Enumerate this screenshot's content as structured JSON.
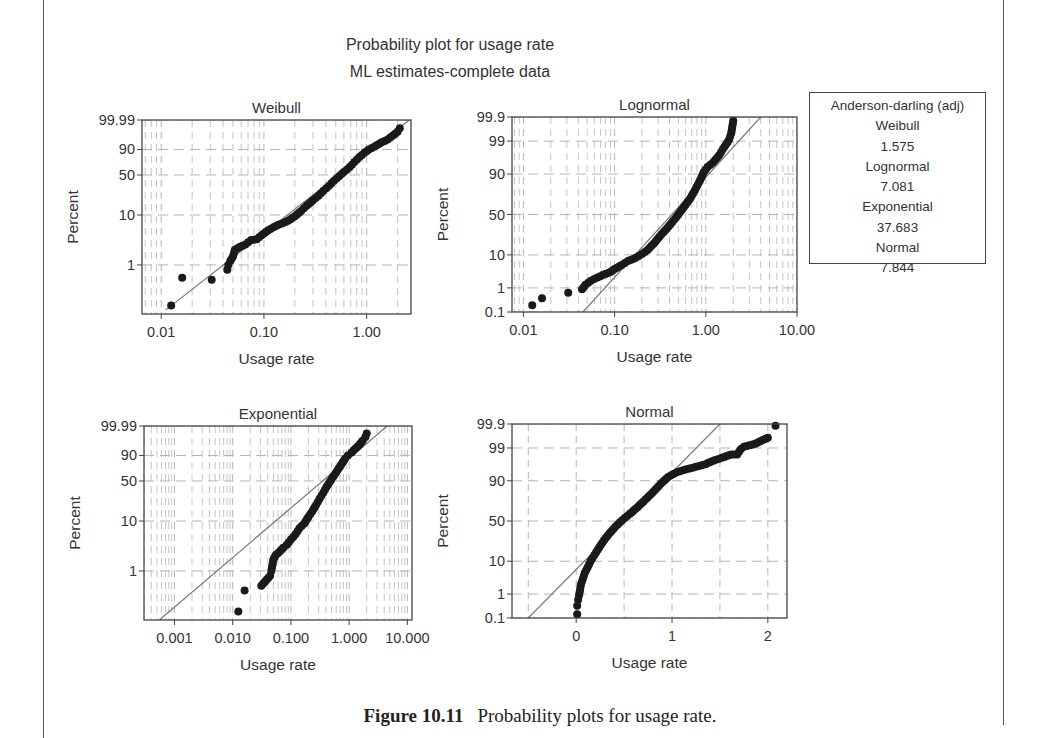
{
  "figure": {
    "title": "Probability plot for usage rate",
    "subtitle": "ML estimates-complete data",
    "caption_label": "Figure 10.11",
    "caption_text": "Probability plots for usage rate."
  },
  "legend": {
    "title": "Anderson-darling (adj)",
    "entries": [
      {
        "name": "Weibull",
        "value": "1.575"
      },
      {
        "name": "Lognormal",
        "value": "7.081"
      },
      {
        "name": "Exponential",
        "value": "37.683"
      },
      {
        "name": "Normal",
        "value": "7.844"
      }
    ]
  },
  "colors": {
    "points": "#1a1a1a",
    "fit_line": "#777777",
    "grid": "#b5b5b5",
    "frame": "#444444"
  },
  "chart_data": [
    {
      "type": "scatter",
      "title": "Weibull",
      "xlabel": "Usage rate",
      "ylabel": "Percent",
      "xscale": "log",
      "yscale": "weibull-probability",
      "xticks": [
        0.01,
        0.1,
        1.0
      ],
      "xtick_labels": [
        "0.01",
        "0.10",
        "1.00"
      ],
      "yticks": [
        1,
        10,
        50,
        90,
        99.99
      ],
      "ytick_labels": [
        "1",
        "10",
        "50",
        "90",
        "99.99"
      ],
      "xlim": [
        0.0065,
        2.7
      ],
      "ylim": [
        0.1,
        99.99
      ],
      "grid": true,
      "frame": {
        "x": 142,
        "y": 120,
        "w": 269,
        "h": 194
      },
      "fit_line": [
        [
          0.011,
          0.12
        ],
        [
          2.6,
          99.99
        ]
      ],
      "points": [
        [
          0.0125,
          0.15
        ],
        [
          0.016,
          0.55
        ],
        [
          0.031,
          0.5
        ],
        [
          0.044,
          0.8
        ],
        [
          0.045,
          1.0
        ],
        [
          0.047,
          1.2
        ],
        [
          0.05,
          1.5
        ],
        [
          0.052,
          2.0
        ],
        [
          0.058,
          2.3
        ],
        [
          0.066,
          2.6
        ],
        [
          0.075,
          3.2
        ],
        [
          0.085,
          3.3
        ],
        [
          0.095,
          4.0
        ],
        [
          0.11,
          5.0
        ],
        [
          0.125,
          5.8
        ],
        [
          0.14,
          6.5
        ],
        [
          0.16,
          7.2
        ],
        [
          0.18,
          8.2
        ],
        [
          0.2,
          9.5
        ],
        [
          0.23,
          12
        ],
        [
          0.26,
          15
        ],
        [
          0.3,
          19
        ],
        [
          0.34,
          23
        ],
        [
          0.38,
          28
        ],
        [
          0.43,
          34
        ],
        [
          0.48,
          41
        ],
        [
          0.54,
          48
        ],
        [
          0.6,
          55
        ],
        [
          0.68,
          63
        ],
        [
          0.76,
          72
        ],
        [
          0.85,
          80
        ],
        [
          0.95,
          86
        ],
        [
          1.05,
          90
        ],
        [
          1.2,
          93
        ],
        [
          1.4,
          96
        ],
        [
          1.6,
          97.5
        ],
        [
          1.8,
          98.8
        ],
        [
          2.0,
          99.5
        ],
        [
          2.1,
          99.8
        ]
      ]
    },
    {
      "type": "scatter",
      "title": "Lognormal",
      "xlabel": "Usage rate",
      "ylabel": "Percent",
      "xscale": "log",
      "yscale": "normal-probability",
      "xticks": [
        0.01,
        0.1,
        1.0,
        10.0
      ],
      "xtick_labels": [
        "0.01",
        "0.10",
        "1.00",
        "10.00"
      ],
      "yticks": [
        0.1,
        1,
        10,
        50,
        90,
        99,
        99.9
      ],
      "ytick_labels": [
        "0.1",
        "1",
        "10",
        "50",
        "90",
        "99",
        "99.9"
      ],
      "xlim": [
        0.0075,
        10.0
      ],
      "ylim": [
        0.1,
        99.9
      ],
      "grid": true,
      "frame": {
        "x": 512,
        "y": 117,
        "w": 285,
        "h": 195
      },
      "fit_line": [
        [
          0.045,
          0.1
        ],
        [
          4.0,
          99.9
        ]
      ],
      "points": [
        [
          0.0125,
          0.2
        ],
        [
          0.016,
          0.4
        ],
        [
          0.031,
          0.65
        ],
        [
          0.044,
          0.9
        ],
        [
          0.048,
          1.3
        ],
        [
          0.055,
          1.8
        ],
        [
          0.065,
          2.3
        ],
        [
          0.075,
          2.8
        ],
        [
          0.09,
          3.4
        ],
        [
          0.1,
          4.2
        ],
        [
          0.12,
          5.5
        ],
        [
          0.14,
          7.0
        ],
        [
          0.17,
          8.5
        ],
        [
          0.2,
          10.5
        ],
        [
          0.23,
          13
        ],
        [
          0.27,
          18
        ],
        [
          0.31,
          24
        ],
        [
          0.36,
          31
        ],
        [
          0.41,
          38
        ],
        [
          0.47,
          46
        ],
        [
          0.53,
          54
        ],
        [
          0.6,
          62
        ],
        [
          0.68,
          70
        ],
        [
          0.76,
          78
        ],
        [
          0.85,
          85
        ],
        [
          0.95,
          91
        ],
        [
          1.05,
          93.5
        ],
        [
          1.2,
          95
        ],
        [
          1.4,
          97
        ],
        [
          1.6,
          98.4
        ],
        [
          1.8,
          99.1
        ],
        [
          1.9,
          99.5
        ],
        [
          2.0,
          99.85
        ]
      ]
    },
    {
      "type": "scatter",
      "title": "Exponential",
      "xlabel": "Usage rate",
      "ylabel": "Percent",
      "xscale": "log",
      "yscale": "weibull-probability",
      "xticks": [
        0.001,
        0.01,
        0.1,
        1.0,
        10.0
      ],
      "xtick_labels": [
        "0.001",
        "0.010",
        "0.100",
        "1.000",
        "10.000"
      ],
      "yticks": [
        1,
        10,
        50,
        90,
        99.99
      ],
      "ytick_labels": [
        "1",
        "10",
        "50",
        "90",
        "99.99"
      ],
      "xlim": [
        0.0003,
        12.0
      ],
      "ylim": [
        0.1,
        99.99
      ],
      "grid": true,
      "frame": {
        "x": 144,
        "y": 426,
        "w": 268,
        "h": 194
      },
      "fit_line": [
        [
          0.00055,
          0.1
        ],
        [
          4.5,
          99.99
        ]
      ],
      "points": [
        [
          0.0125,
          0.15
        ],
        [
          0.016,
          0.4
        ],
        [
          0.031,
          0.5
        ],
        [
          0.044,
          0.8
        ],
        [
          0.046,
          1.0
        ],
        [
          0.048,
          1.3
        ],
        [
          0.05,
          1.7
        ],
        [
          0.055,
          2.1
        ],
        [
          0.065,
          2.5
        ],
        [
          0.075,
          3.0
        ],
        [
          0.085,
          3.4
        ],
        [
          0.1,
          4.3
        ],
        [
          0.12,
          5.5
        ],
        [
          0.14,
          7.2
        ],
        [
          0.17,
          9
        ],
        [
          0.2,
          12
        ],
        [
          0.23,
          15
        ],
        [
          0.27,
          20
        ],
        [
          0.31,
          26
        ],
        [
          0.36,
          33
        ],
        [
          0.41,
          41
        ],
        [
          0.47,
          49
        ],
        [
          0.53,
          57
        ],
        [
          0.6,
          65
        ],
        [
          0.68,
          73
        ],
        [
          0.76,
          80
        ],
        [
          0.85,
          86
        ],
        [
          0.95,
          90
        ],
        [
          1.1,
          93
        ],
        [
          1.3,
          96
        ],
        [
          1.5,
          97.8
        ],
        [
          1.7,
          99
        ],
        [
          1.9,
          99.6
        ],
        [
          2.0,
          99.85
        ]
      ]
    },
    {
      "type": "scatter",
      "title": "Normal",
      "xlabel": "Usage rate",
      "ylabel": "Percent",
      "xscale": "linear",
      "yscale": "normal-probability",
      "xticks": [
        0,
        1,
        2
      ],
      "xtick_labels": [
        "0",
        "1",
        "2"
      ],
      "yticks": [
        0.1,
        1,
        10,
        50,
        90,
        99,
        99.9
      ],
      "ytick_labels": [
        "0.1",
        "1",
        "10",
        "50",
        "90",
        "99",
        "99.9"
      ],
      "xlim": [
        -0.67,
        2.2
      ],
      "ylim": [
        0.1,
        99.9
      ],
      "grid": true,
      "frame": {
        "x": 512,
        "y": 424,
        "w": 275,
        "h": 194
      },
      "fit_line": [
        [
          -0.5,
          0.1
        ],
        [
          1.5,
          99.9
        ]
      ],
      "points": [
        [
          0.01,
          0.15
        ],
        [
          0.01,
          0.35
        ],
        [
          0.02,
          0.6
        ],
        [
          0.03,
          0.9
        ],
        [
          0.04,
          1.4
        ],
        [
          0.05,
          2.2
        ],
        [
          0.07,
          3.3
        ],
        [
          0.09,
          5
        ],
        [
          0.12,
          7
        ],
        [
          0.15,
          10
        ],
        [
          0.19,
          14
        ],
        [
          0.24,
          20
        ],
        [
          0.29,
          27
        ],
        [
          0.35,
          35
        ],
        [
          0.41,
          43
        ],
        [
          0.48,
          51
        ],
        [
          0.56,
          59
        ],
        [
          0.64,
          67
        ],
        [
          0.72,
          75
        ],
        [
          0.8,
          82
        ],
        [
          0.88,
          88
        ],
        [
          0.96,
          92
        ],
        [
          1.05,
          94
        ],
        [
          1.15,
          95
        ],
        [
          1.25,
          95.8
        ],
        [
          1.35,
          96.5
        ],
        [
          1.45,
          97.4
        ],
        [
          1.52,
          97.8
        ],
        [
          1.62,
          98.3
        ],
        [
          1.68,
          98.3
        ],
        [
          1.72,
          98.9
        ],
        [
          1.75,
          99.1
        ],
        [
          1.87,
          99.3
        ],
        [
          1.92,
          99.45
        ],
        [
          2.0,
          99.6
        ],
        [
          2.08,
          99.88
        ]
      ]
    }
  ]
}
